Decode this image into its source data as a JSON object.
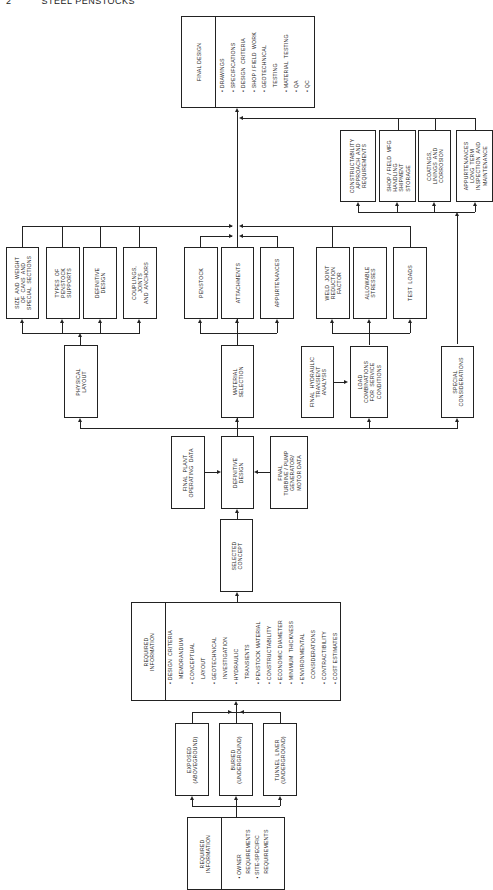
{
  "header": {
    "page_number": "2",
    "running_title": "STEEL PENSTOCKS"
  },
  "final_design": {
    "title": "FINAL DESIGN",
    "items": "• DRAWINGS\n• SPECIFICATIONS\n• DESIGN  CRITERIA\n• SHOP / FIELD  WORK\n• GEOTECHNICAL\n   TESTING\n• MATERIAL  TESTING\n• QA\n• QC"
  },
  "special_group": {
    "boxes": [
      "CONSTRUCTABILITY\nAPPROACH  AND\nREQUIREMENTS",
      "SHOP / FIELD  MFG\nHANDLING\nSHIPMENT\nSTORAGE",
      "COATINGS,\nLININGS  AND\nCORROSION",
      "APPURTENANCES\nLONG  TERM\nINSPECTION  AND\nMAINTENANCE"
    ]
  },
  "physical_group": {
    "boxes": [
      "SIZE  AND  WEIGHT\nOF  CANS  AND\nSPECIAL  SECTIONS",
      "TYPES  OF\nPENSTOCK\nSUPPORTS",
      "DEFINITIVE\nDESIGN",
      "COUPLINGS,\nJOINTS\nAND  ANCHORS"
    ]
  },
  "material_group": {
    "boxes": [
      "PENSTOCK",
      "ATTACHMENTS",
      "APPURTENANCES"
    ]
  },
  "load_group": {
    "boxes": [
      "WELD  JOINT\nREDUCTION\nFACTOR",
      "ALLOWABLE\nSTRESSES",
      "TEST  LOADS"
    ]
  },
  "second_row": {
    "physical_layout": "PHYSICAL\nLAYOUT",
    "material_selection": "MATERIAL\nSELECTION",
    "final_hydraulic": "FINAL  HYDRAULIC\nTRANSIENT\nANALYSIS",
    "load_combinations": "LOAD\nCOMBINATIONS\nFOR  SERVICE\nCONDITIONS",
    "special_considerations": "SPECIAL\nCONSIDERATIONS"
  },
  "definitive_row": {
    "final_plant": "FINAL  PLANT\nOPERATING  DATA",
    "definitive_design": "DEFINITIVE\nDESIGN",
    "final_turbine": "FINAL\nTURBINE / PUMP\nGENERATOR/\nMOTOR DATA"
  },
  "selected_concept": "SELECTED\nCONCEPT",
  "required_info_main": {
    "title": "REQUIRED\nINFORMATION",
    "items": "• DESIGN  CRITERIA\n   MEMORANDUM\n• CONCEPTUAL\n   LAYOUT\n• GEOTECHNICAL\n   INVESTIGATION\n• HYDRAULIC\n   TRANSIENTS\n• PENSTOCK MATERIAL\n• CONSTRUCTABILITY\n• ECONOMIC DIAMETER\n• MINIMUM  THICKNESS\n• ENVIRONMENTAL\n   CONSIDERATIONS\n• CONTRACTIBILITY\n• COST ESTIMATES"
  },
  "types": {
    "boxes": [
      "EXPOSED\n(ABOVEGROUND)",
      "BURIED\n(UNDERGROUND)",
      "TUNNEL  LINER\n(UNDERGROUND)"
    ]
  },
  "required_info_start": {
    "title": "REQUIRED\nINFORMATION",
    "items": "• OWNER\n   REQUIREMENTS\n• SITE-SPECIFIC\n   REQUIREMENTS"
  }
}
